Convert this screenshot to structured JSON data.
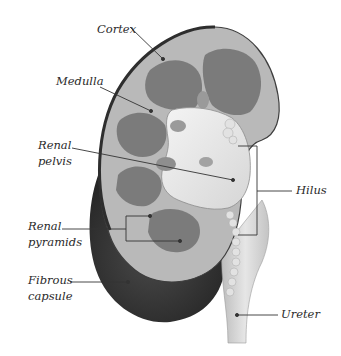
{
  "diagram": {
    "colors": {
      "background": "#ffffff",
      "capsule_dark": "#3a3a3a",
      "cortex": "#b8b8b8",
      "medulla": "#7d7d7d",
      "pelvis": "#ececec",
      "ureter": "#d2d2d2",
      "leader_line": "#333333"
    },
    "labels": [
      {
        "id": "cortex",
        "lines": [
          "Cortex"
        ]
      },
      {
        "id": "medulla",
        "lines": [
          "Medulla"
        ]
      },
      {
        "id": "renal-pelvis",
        "lines": [
          "Renal",
          "pelvis"
        ]
      },
      {
        "id": "hilus",
        "lines": [
          "Hilus"
        ]
      },
      {
        "id": "renal-pyramids",
        "lines": [
          "Renal",
          "pyramids"
        ]
      },
      {
        "id": "fibrous-capsule",
        "lines": [
          "Fibrous",
          "capsule"
        ]
      },
      {
        "id": "ureter",
        "lines": [
          "Ureter"
        ]
      }
    ]
  }
}
